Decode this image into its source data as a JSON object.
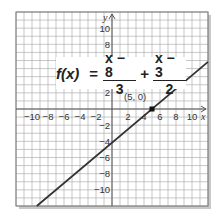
{
  "chart_data": {
    "type": "line",
    "title": "",
    "equation": {
      "lhs": "f(x)",
      "equals": "=",
      "term1": {
        "numerator": "x − 8",
        "denominator": "3"
      },
      "operator": "+",
      "term2": {
        "numerator": "x − 3",
        "denominator": "2"
      }
    },
    "xlabel": "x",
    "ylabel": "y",
    "xlim": [
      -12,
      12
    ],
    "ylim": [
      -12,
      12
    ],
    "grid": true,
    "grid_step": 1,
    "x_ticks": [
      -10,
      -8,
      -6,
      -4,
      -2,
      2,
      4,
      6,
      8,
      10
    ],
    "x_tick_labels": [
      "−10",
      "−8",
      "−6",
      "−4",
      "−2",
      "2",
      "4",
      "6",
      "8",
      "10"
    ],
    "y_ticks": [
      10,
      8,
      2,
      -2,
      -4,
      -6,
      -8,
      -10
    ],
    "y_tick_labels": [
      "10",
      "8",
      "2",
      "−2",
      "−4",
      "−6",
      "−8",
      "−10"
    ],
    "series": [
      {
        "name": "f(x)",
        "slope": 0.8333,
        "intercept": -4.1667,
        "x": [
          -9.4,
          12
        ],
        "y": [
          -12,
          5.83
        ],
        "color": "#333333"
      }
    ],
    "annotations": [
      {
        "label": "(5, 0)",
        "x": 5,
        "y": 0,
        "marker": "point"
      }
    ]
  },
  "colors": {
    "grid": "#b0b0b0",
    "axis": "#555555",
    "line": "#333333",
    "frame_shadow": "#9a9a9a"
  }
}
